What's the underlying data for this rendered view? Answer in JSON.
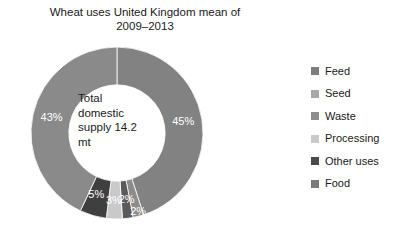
{
  "chart_data": {
    "type": "pie",
    "title": "Wheat uses United Kingdom mean of\n2009–2013",
    "subtitle": "",
    "xlabel": "",
    "ylabel": "",
    "center_label": "Total\ndomestic\nsupply 14.2\nmt",
    "legend_position": "right",
    "donut": true,
    "inner_radius_ratio": 0.56,
    "start_angle_deg": 0,
    "direction": "clockwise",
    "categories": [
      "Feed",
      "Food",
      "Other uses",
      "Processing",
      "Waste",
      "Seed"
    ],
    "values": [
      45,
      2,
      2,
      3,
      5,
      43
    ],
    "labels": [
      "45%",
      "2%",
      "2%",
      "3%",
      "5%",
      "43%"
    ],
    "colors": [
      "#828282",
      "#8c8c8c",
      "#5a5a5a",
      "#c9c9c9",
      "#3f3f3f",
      "#8a8a8a"
    ],
    "slices": [
      {
        "name": "Feed",
        "value": 45,
        "label": "45%",
        "color": "#828282"
      },
      {
        "name": "Food",
        "value": 2,
        "label": "2%",
        "color": "#8c8c8c"
      },
      {
        "name": "Other uses",
        "value": 2,
        "label": "2%",
        "color": "#5a5a5a"
      },
      {
        "name": "Processing",
        "value": 3,
        "label": "3%",
        "color": "#c9c9c9"
      },
      {
        "name": "Waste",
        "value": 5,
        "label": "5%",
        "color": "#3f3f3f"
      },
      {
        "name": "Seed",
        "value": 43,
        "label": "43%",
        "color": "#8a8a8a"
      }
    ],
    "legend_entries": [
      {
        "label": "Feed",
        "color": "#7e7e7e"
      },
      {
        "label": "Seed",
        "color": "#a8a8a8"
      },
      {
        "label": "Waste",
        "color": "#8e8e8e"
      },
      {
        "label": "Processing",
        "color": "#c9c9c9"
      },
      {
        "label": "Other uses",
        "color": "#4a4a4a"
      },
      {
        "label": "Food",
        "color": "#7a7a7a"
      }
    ]
  },
  "title": {
    "text": "Wheat uses United Kingdom mean of\n2009–2013"
  },
  "center": {
    "text": "Total\ndomestic\nsupply 14.2\nmt"
  }
}
